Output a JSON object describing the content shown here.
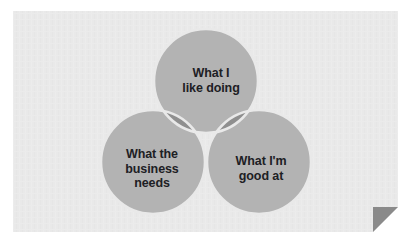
{
  "card": {
    "background_color": "#e9e9e9",
    "texture": "subtle-paper-grain",
    "corner_fold": {
      "name": "page-curl",
      "fold_color": "#8a8a8a",
      "behind_color": "#ffffff"
    }
  },
  "diagram": {
    "type": "venn",
    "set_count": 3,
    "circle_fill": "#b3b3b3",
    "overlap_two_fill": "#8f8f8f",
    "overlap_three_fill": "#6e6e6e",
    "stroke_color": "#e9e9e9",
    "text_color": "#1d2024",
    "circles": [
      {
        "id": "top",
        "label": "What I\nlike doing",
        "cx": 193,
        "cy": 70,
        "r": 52
      },
      {
        "id": "left",
        "label": "What the\nbusiness\nneeds",
        "cx": 140,
        "cy": 151,
        "r": 52
      },
      {
        "id": "right",
        "label": "What I'm\ngood at",
        "cx": 246,
        "cy": 151,
        "r": 52
      }
    ]
  }
}
